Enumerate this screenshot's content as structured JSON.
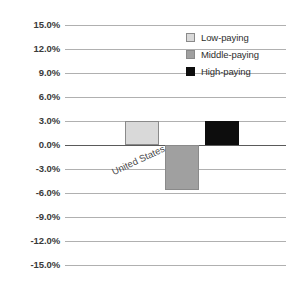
{
  "chart_data": {
    "type": "bar",
    "title": "",
    "subtitle": "",
    "xlabel": "",
    "ylabel": "",
    "categories": [
      "United States"
    ],
    "series": [
      {
        "name": "Low-paying",
        "values": [
          3.0
        ],
        "color": "#d9d9d9"
      },
      {
        "name": "Middle-paying",
        "values": [
          -5.6
        ],
        "color": "#a0a0a0"
      },
      {
        "name": "High-paying",
        "values": [
          3.0
        ],
        "color": "#0d0d0d"
      }
    ],
    "ylim": [
      -15.0,
      15.0
    ],
    "ytick_step": 3.0,
    "ytick_labels": [
      "15.0%",
      "12.0%",
      "9.0%",
      "6.0%",
      "3.0%",
      "0.0%",
      "-3.0%",
      "-6.0%",
      "-9.0%",
      "-12.0%",
      "-15.0%"
    ],
    "ytick_values": [
      15,
      12,
      9,
      6,
      3,
      0,
      -3,
      -6,
      -9,
      -12,
      -15
    ],
    "grid": true,
    "grid_axis": "y",
    "zero_line": true,
    "legend_position": "top-right",
    "legend_entries": [
      "Low-paying",
      "Middle-paying",
      "High-paying"
    ],
    "gridline_color": "#b0b0b0",
    "zero_line_color": "#5a5a5a",
    "background_color": "#ffffff",
    "category_label_rotation": -25
  }
}
